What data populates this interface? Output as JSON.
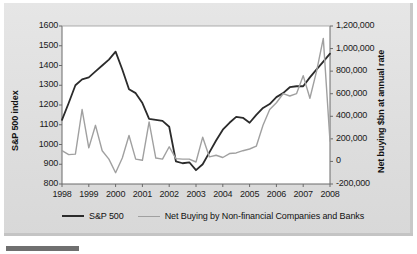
{
  "figure": {
    "background_color": "#e2e2e2",
    "plot_background_color": "#ffffff"
  },
  "chart_data": {
    "type": "line",
    "title": "",
    "subtitle": "",
    "xlabel": "",
    "grid": false,
    "legend_position": "bottom",
    "x_tick_labels": [
      "1998",
      "1999",
      "2000",
      "2001",
      "2002",
      "2003",
      "2004",
      "2005",
      "2006",
      "2007",
      "2008"
    ],
    "xlim": [
      1998,
      2008
    ],
    "axes": [
      {
        "id": "left",
        "label": "S&P 500 index",
        "ylim": [
          800,
          1600
        ],
        "tick_labels": [
          "1600",
          "1500",
          "1400",
          "1300",
          "1200",
          "1100",
          "1000",
          "900",
          "800"
        ],
        "tick_values": [
          1600,
          1500,
          1400,
          1300,
          1200,
          1100,
          1000,
          900,
          800
        ]
      },
      {
        "id": "right",
        "label": "Net buying $bn at annual rate",
        "ylim": [
          -200000,
          1200000
        ],
        "tick_labels": [
          "1,200,000",
          "1,000,000",
          "800,000",
          "600,000",
          "400,000",
          "200,000",
          "0",
          "-200,000"
        ],
        "tick_values": [
          1200000,
          1000000,
          800000,
          600000,
          400000,
          200000,
          0,
          -200000
        ]
      }
    ],
    "series": [
      {
        "name": "S&P 500",
        "axis": "left",
        "color": "#2b2b2b",
        "line_width": 1.8,
        "x": [
          1998.0,
          1998.25,
          1998.5,
          1998.75,
          1999.0,
          1999.25,
          1999.5,
          1999.75,
          2000.0,
          2000.25,
          2000.5,
          2000.75,
          2001.0,
          2001.25,
          2001.5,
          2001.75,
          2002.0,
          2002.25,
          2002.5,
          2002.75,
          2003.0,
          2003.25,
          2003.5,
          2003.75,
          2004.0,
          2004.25,
          2004.5,
          2004.75,
          2005.0,
          2005.25,
          2005.5,
          2005.75,
          2006.0,
          2006.25,
          2006.5,
          2006.75,
          2007.0,
          2007.25,
          2007.5,
          2007.75,
          2008.0
        ],
        "values": [
          1125,
          1210,
          1300,
          1330,
          1340,
          1370,
          1400,
          1430,
          1470,
          1380,
          1280,
          1260,
          1210,
          1130,
          1125,
          1120,
          1090,
          915,
          905,
          910,
          870,
          900,
          960,
          1020,
          1075,
          1110,
          1140,
          1135,
          1110,
          1150,
          1185,
          1205,
          1240,
          1260,
          1290,
          1295,
          1295,
          1340,
          1380,
          1420,
          1460
        ]
      },
      {
        "name": "Net Buying by Non-financial Companies and Banks",
        "axis": "right",
        "color": "#a0a0a0",
        "line_width": 1.4,
        "x": [
          1998.0,
          1998.25,
          1998.5,
          1998.75,
          1999.0,
          1999.25,
          1999.5,
          1999.75,
          2000.0,
          2000.25,
          2000.5,
          2000.75,
          2001.0,
          2001.25,
          2001.5,
          2001.75,
          2002.0,
          2002.25,
          2002.5,
          2002.75,
          2003.0,
          2003.25,
          2003.5,
          2003.75,
          2004.0,
          2004.25,
          2004.5,
          2004.75,
          2005.0,
          2005.25,
          2005.5,
          2005.75,
          2006.0,
          2006.25,
          2006.5,
          2006.75,
          2007.0,
          2007.25,
          2007.5,
          2007.75,
          2008.0
        ],
        "values": [
          95000,
          60000,
          65000,
          460000,
          120000,
          320000,
          95000,
          20000,
          -100000,
          30000,
          230000,
          20000,
          10000,
          350000,
          30000,
          20000,
          130000,
          25000,
          20000,
          20000,
          -5000,
          215000,
          40000,
          55000,
          35000,
          70000,
          75000,
          95000,
          110000,
          135000,
          320000,
          460000,
          520000,
          600000,
          580000,
          600000,
          760000,
          560000,
          800000,
          1090000,
          180000
        ]
      }
    ],
    "annotations": {
      "sp500_peak_1999": 1470,
      "sp500_trough_2002": 870,
      "sp500_peak_2007": 1505,
      "sp500_end_2008": 920,
      "netbuying_peak_2007": 1090000,
      "netbuying_trough_2000": -100000
    }
  },
  "legend": {
    "entries": [
      {
        "label": "S&P 500",
        "color": "#2b2b2b"
      },
      {
        "label": "Net Buying by Non-financial Companies and Banks",
        "color": "#a0a0a0"
      }
    ]
  }
}
